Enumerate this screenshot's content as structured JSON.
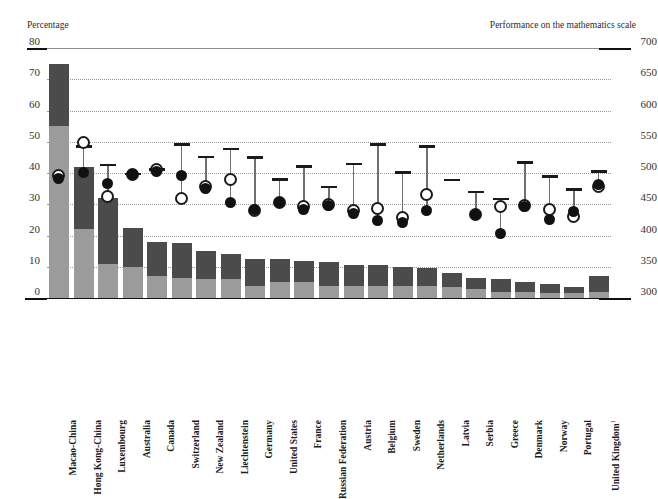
{
  "axes": {
    "left_caption": "Percentage",
    "right_caption": "Performance on the mathematics scale",
    "left_ticks": [
      "80",
      "70",
      "60",
      "50",
      "40",
      "30",
      "20",
      "10",
      "0"
    ],
    "right_ticks": [
      "700",
      "650",
      "600",
      "550",
      "500",
      "450",
      "400",
      "350",
      "300"
    ]
  },
  "chart_data": {
    "type": "bar",
    "title": "",
    "subtitle": "",
    "xlabel": "",
    "ylabel": "Percentage",
    "ylabel_right": "Performance on the mathematics scale",
    "ylim": [
      0,
      80
    ],
    "ylim_right": [
      300,
      700
    ],
    "grid": true,
    "legend": "none",
    "categories": [
      "Macao-China",
      "Hong Kong-China",
      "Luxembourg",
      "Australia",
      "Canada",
      "Switzerland",
      "New Zealand",
      "Liechtenstein",
      "Germany",
      "United States",
      "France",
      "Russian Federation",
      "Austria",
      "Belgium",
      "Sweden",
      "Netherlands",
      "Latvia",
      "Serbia",
      "Greece",
      "Denmark",
      "Norway",
      "Portugal",
      "United Kingdom"
    ],
    "category_footnotes": {
      "United Kingdom": "1"
    },
    "series": [
      {
        "name": "Percentage of students with an immigrant background (lower segment, light grey)",
        "axis": "left",
        "values": [
          55,
          22,
          11,
          10,
          7,
          6.5,
          6,
          6,
          4,
          5,
          5,
          4,
          4,
          4,
          4,
          4,
          3.5,
          3,
          2,
          2,
          1.5,
          1.5,
          2
        ]
      },
      {
        "name": "Percentage of students with an immigrant background (upper segment, dark grey)",
        "axis": "left",
        "values": [
          20,
          20,
          21,
          12.5,
          11,
          11,
          9,
          8,
          8.5,
          7.5,
          7,
          7.5,
          6.5,
          6.5,
          6,
          5.5,
          4.5,
          3.5,
          4,
          3,
          3,
          2,
          5
        ]
      },
      {
        "name": "Total percentage of students with an immigrant background",
        "axis": "left",
        "values": [
          75,
          42,
          32,
          22.5,
          18,
          17.5,
          15,
          14,
          12.5,
          12.5,
          12,
          11.5,
          10.5,
          10.5,
          10,
          9.5,
          8,
          6.5,
          6,
          5,
          4.5,
          3.5,
          7
        ]
      },
      {
        "name": "Native students (range-cap marker)",
        "axis": "right",
        "values": [
          null,
          543,
          513,
          499,
          506,
          546,
          526,
          539,
          525,
          490,
          511,
          478,
          515,
          546,
          501,
          543,
          489,
          470,
          459,
          517,
          495,
          474,
          503
        ]
      },
      {
        "name": "Second-generation students (open circle)",
        "axis": "right",
        "values": [
          497,
          550,
          463,
          499,
          506,
          460,
          479,
          490,
          441,
          453,
          448,
          451,
          441,
          444,
          429,
          466,
          null,
          435,
          448,
          449,
          443,
          432,
          479
        ]
      },
      {
        "name": "First-generation students (solid dot)",
        "axis": "right",
        "values": [
          492,
          501,
          484,
          499,
          504,
          497,
          476,
          454,
          443,
          453,
          442,
          449,
          436,
          425,
          422,
          441,
          null,
          434,
          404,
          448,
          427,
          440,
          483
        ]
      }
    ]
  },
  "bars": [
    {
      "country": "Macao-China",
      "low": 55,
      "high": 20
    },
    {
      "country": "Hong Kong-China",
      "low": 22,
      "high": 20
    },
    {
      "country": "Luxembourg",
      "low": 11,
      "high": 21
    },
    {
      "country": "Australia",
      "low": 10,
      "high": 12.5
    },
    {
      "country": "Canada",
      "low": 7,
      "high": 11
    },
    {
      "country": "Switzerland",
      "low": 6.5,
      "high": 11
    },
    {
      "country": "New Zealand",
      "low": 6,
      "high": 9
    },
    {
      "country": "Liechtenstein",
      "low": 6,
      "high": 8
    },
    {
      "country": "Germany",
      "low": 4,
      "high": 8.5
    },
    {
      "country": "United States",
      "low": 5,
      "high": 7.5
    },
    {
      "country": "France",
      "low": 5,
      "high": 7
    },
    {
      "country": "Russian Federation",
      "low": 4,
      "high": 7.5
    },
    {
      "country": "Austria",
      "low": 4,
      "high": 6.5
    },
    {
      "country": "Belgium",
      "low": 4,
      "high": 6.5
    },
    {
      "country": "Sweden",
      "low": 4,
      "high": 6
    },
    {
      "country": "Netherlands",
      "low": 4,
      "high": 5.5
    },
    {
      "country": "Latvia",
      "low": 3.5,
      "high": 4.5
    },
    {
      "country": "Serbia",
      "low": 3,
      "high": 3.5
    },
    {
      "country": "Greece",
      "low": 2,
      "high": 4
    },
    {
      "country": "Denmark",
      "low": 2,
      "high": 3
    },
    {
      "country": "Norway",
      "low": 1.5,
      "high": 3
    },
    {
      "country": "Portugal",
      "low": 1.5,
      "high": 2
    },
    {
      "country": "United Kingdom",
      "low": 2,
      "high": 5
    }
  ],
  "markers": [
    {
      "country": "Macao-China",
      "cap": null,
      "open": 497,
      "solid": 492
    },
    {
      "country": "Hong Kong-China",
      "cap": 543,
      "open": 550,
      "solid": 501
    },
    {
      "country": "Luxembourg",
      "cap": 513,
      "open": 463,
      "solid": 484
    },
    {
      "country": "Australia",
      "cap": 499,
      "open": 499,
      "solid": 499
    },
    {
      "country": "Canada",
      "cap": 506,
      "open": 506,
      "solid": 504
    },
    {
      "country": "Switzerland",
      "cap": 546,
      "open": 460,
      "solid": 497
    },
    {
      "country": "New Zealand",
      "cap": 526,
      "open": 479,
      "solid": 476
    },
    {
      "country": "Liechtenstein",
      "cap": 539,
      "open": 490,
      "solid": 454
    },
    {
      "country": "Germany",
      "cap": 525,
      "open": 441,
      "solid": 443
    },
    {
      "country": "United States",
      "cap": 490,
      "open": 453,
      "solid": 453
    },
    {
      "country": "France",
      "cap": 511,
      "open": 448,
      "solid": 442
    },
    {
      "country": "Russian Federation",
      "cap": 478,
      "open": 451,
      "solid": 449
    },
    {
      "country": "Austria",
      "cap": 515,
      "open": 441,
      "solid": 436
    },
    {
      "country": "Belgium",
      "cap": 546,
      "open": 444,
      "solid": 425
    },
    {
      "country": "Sweden",
      "cap": 501,
      "open": 429,
      "solid": 422
    },
    {
      "country": "Netherlands",
      "cap": 543,
      "open": 466,
      "solid": 441
    },
    {
      "country": "Latvia",
      "cap": 489,
      "open": null,
      "solid": null
    },
    {
      "country": "Serbia",
      "cap": 470,
      "open": 435,
      "solid": 434
    },
    {
      "country": "Greece",
      "cap": 459,
      "open": 448,
      "solid": 404
    },
    {
      "country": "Denmark",
      "cap": 517,
      "open": 449,
      "solid": 448
    },
    {
      "country": "Norway",
      "cap": 495,
      "open": 443,
      "solid": 427
    },
    {
      "country": "Portugal",
      "cap": 474,
      "open": 432,
      "solid": 440
    },
    {
      "country": "United Kingdom",
      "cap": 503,
      "open": 479,
      "solid": 483
    }
  ],
  "colors": {
    "bar_low": "#9b9b9b",
    "bar_high": "#4b4b4b",
    "marker_dark": "#111111",
    "range_line": "#6f6f6f",
    "grid": "#9a9a9a"
  }
}
